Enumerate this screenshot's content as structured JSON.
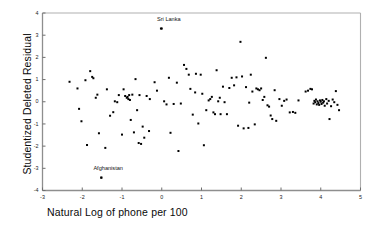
{
  "chart_data": {
    "type": "scatter",
    "title": "",
    "xlabel": "Natural Log of phone per 100",
    "ylabel": "Studentized Deleted Residual",
    "xlim": [
      -3,
      5
    ],
    "ylim": [
      -4,
      4
    ],
    "xticks": [
      -3,
      -2,
      -1,
      0,
      1,
      2,
      3,
      4,
      5
    ],
    "yticks": [
      -4,
      -3,
      -2,
      -1,
      0,
      1,
      2,
      3,
      4
    ],
    "xtick_labels": [
      "-3",
      "-2",
      "-1",
      "0",
      "1",
      "2",
      "3",
      "4",
      "5"
    ],
    "ytick_labels": [
      "-4",
      "-3",
      "-2",
      "-1",
      "0",
      "1",
      "2",
      "3",
      "4"
    ],
    "grid": false,
    "legend": false,
    "marker": "square",
    "marker_color": "#000000",
    "marker_size": 2,
    "frame_color": "#b0b0b0",
    "annotations": [
      {
        "label": "Sri Lanka",
        "x": 0.0,
        "y": 3.3,
        "label_x": -0.12,
        "label_y": 3.68
      },
      {
        "label": "Afghanistan",
        "x": -1.52,
        "y": -3.42,
        "label_x": -1.72,
        "label_y": -3.05
      }
    ],
    "points": [
      [
        -2.32,
        0.9
      ],
      [
        -2.08,
        -0.32
      ],
      [
        -2.02,
        -0.88
      ],
      [
        -1.92,
        0.97
      ],
      [
        -1.88,
        -1.95
      ],
      [
        -1.8,
        1.38
      ],
      [
        -1.75,
        1.12
      ],
      [
        -1.72,
        1.06
      ],
      [
        -1.66,
        0.18
      ],
      [
        -1.62,
        0.32
      ],
      [
        -1.58,
        -1.42
      ],
      [
        -1.52,
        -3.42
      ],
      [
        -1.42,
        -2.08
      ],
      [
        -1.38,
        0.56
      ],
      [
        -1.3,
        -0.63
      ],
      [
        -1.22,
        -0.47
      ],
      [
        -1.18,
        0.02
      ],
      [
        -1.12,
        -0.02
      ],
      [
        -1.08,
        0.3
      ],
      [
        -1.0,
        -1.48
      ],
      [
        -0.96,
        0.56
      ],
      [
        -0.92,
        0.26
      ],
      [
        -0.88,
        0.18
      ],
      [
        -0.86,
        0.22
      ],
      [
        -0.84,
        0.12
      ],
      [
        -0.82,
        0.3
      ],
      [
        -0.8,
        0.08
      ],
      [
        -0.78,
        -0.82
      ],
      [
        -0.74,
        0.32
      ],
      [
        -0.7,
        -1.38
      ],
      [
        -0.66,
        1.02
      ],
      [
        -0.62,
        -0.38
      ],
      [
        -0.58,
        -1.86
      ],
      [
        -0.56,
        0.3
      ],
      [
        -0.52,
        -1.9
      ],
      [
        -0.48,
        -1.12
      ],
      [
        -0.44,
        -1.62
      ],
      [
        -0.38,
        0.26
      ],
      [
        -0.32,
        -1.32
      ],
      [
        -0.18,
        0.88
      ],
      [
        -0.12,
        0.5
      ],
      [
        -0.02,
        3.3
      ],
      [
        0.06,
        0.02
      ],
      [
        0.12,
        -0.12
      ],
      [
        0.18,
        1.08
      ],
      [
        0.22,
        -1.4
      ],
      [
        0.3,
        -0.1
      ],
      [
        0.38,
        0.86
      ],
      [
        0.42,
        -2.22
      ],
      [
        0.48,
        -0.08
      ],
      [
        0.56,
        1.66
      ],
      [
        0.62,
        1.48
      ],
      [
        0.68,
        1.22
      ],
      [
        0.72,
        0.58
      ],
      [
        0.78,
        -0.58
      ],
      [
        0.86,
        1.26
      ],
      [
        0.92,
        -0.98
      ],
      [
        0.98,
        1.22
      ],
      [
        1.02,
        0.36
      ],
      [
        1.06,
        -1.96
      ],
      [
        1.12,
        -0.38
      ],
      [
        1.18,
        0.06
      ],
      [
        1.22,
        0.12
      ],
      [
        1.26,
        0.22
      ],
      [
        1.3,
        -0.48
      ],
      [
        1.34,
        -0.56
      ],
      [
        1.38,
        1.42
      ],
      [
        1.42,
        0.02
      ],
      [
        1.48,
        -0.56
      ],
      [
        1.54,
        0.68
      ],
      [
        1.58,
        -0.02
      ],
      [
        1.64,
        -0.56
      ],
      [
        1.7,
        0.62
      ],
      [
        1.76,
        1.08
      ],
      [
        1.82,
        0.74
      ],
      [
        1.88,
        1.1
      ],
      [
        1.92,
        -1.08
      ],
      [
        1.98,
        2.7
      ],
      [
        2.02,
        1.14
      ],
      [
        2.06,
        -1.2
      ],
      [
        2.12,
        0.66
      ],
      [
        2.18,
        -1.18
      ],
      [
        2.24,
        1.22
      ],
      [
        2.28,
        0.46
      ],
      [
        2.34,
        -1.02
      ],
      [
        2.38,
        0.6
      ],
      [
        2.42,
        0.56
      ],
      [
        2.46,
        0.52
      ],
      [
        2.5,
        0.6
      ],
      [
        2.54,
        0.08
      ],
      [
        2.58,
        0.22
      ],
      [
        2.62,
        1.98
      ],
      [
        2.66,
        -0.16
      ],
      [
        2.7,
        -0.22
      ],
      [
        2.74,
        -0.62
      ],
      [
        2.78,
        -0.78
      ],
      [
        2.84,
        0.52
      ],
      [
        2.88,
        -0.86
      ],
      [
        2.96,
        0.12
      ],
      [
        3.02,
        -0.18
      ],
      [
        3.08,
        0.04
      ],
      [
        3.14,
        0.1
      ],
      [
        3.22,
        -0.48
      ],
      [
        3.3,
        -0.46
      ],
      [
        3.36,
        -0.5
      ],
      [
        3.62,
        0.46
      ],
      [
        3.68,
        0.5
      ],
      [
        3.74,
        0.58
      ],
      [
        3.78,
        0.56
      ],
      [
        3.82,
        -0.08
      ],
      [
        3.84,
        0.04
      ],
      [
        3.86,
        -0.02
      ],
      [
        3.88,
        0.1
      ],
      [
        3.9,
        -0.12
      ],
      [
        3.92,
        0.02
      ],
      [
        3.94,
        -0.06
      ],
      [
        3.96,
        -0.14
      ],
      [
        3.98,
        0.06
      ],
      [
        4.0,
        0.0
      ],
      [
        4.02,
        -0.1
      ],
      [
        4.04,
        0.08
      ],
      [
        4.06,
        -0.04
      ],
      [
        4.08,
        0.02
      ],
      [
        4.1,
        -0.18
      ],
      [
        4.14,
        0.12
      ],
      [
        4.16,
        -0.08
      ],
      [
        4.2,
        0.04
      ],
      [
        4.22,
        -0.78
      ],
      [
        4.26,
        -0.2
      ],
      [
        4.3,
        0.1
      ],
      [
        4.34,
        -0.02
      ],
      [
        4.38,
        0.48
      ],
      [
        4.42,
        -0.14
      ],
      [
        4.46,
        -0.38
      ],
      [
        -2.12,
        0.6
      ],
      [
        -0.3,
        0.12
      ],
      [
        0.84,
        0.42
      ],
      [
        1.46,
        0.18
      ],
      [
        2.2,
        -0.04
      ],
      [
        3.44,
        0.06
      ]
    ]
  }
}
